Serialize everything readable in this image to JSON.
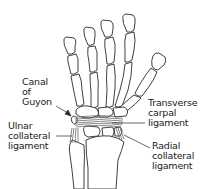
{
  "diagram": {
    "labels": {
      "canal_of_guyon": [
        "Canal",
        "of",
        "Guyon"
      ],
      "ulnar_collateral_ligament": [
        "Ulnar",
        "collateral",
        "ligament"
      ],
      "transverse_carpal_ligament": [
        "Transverse",
        "carpal",
        "ligament"
      ],
      "radial_collateral_ligament": [
        "Radial",
        "collateral",
        "ligament"
      ]
    },
    "colors": {
      "line": "#2a2a2a",
      "ligament": "#555555",
      "background": "#ffffff"
    }
  }
}
